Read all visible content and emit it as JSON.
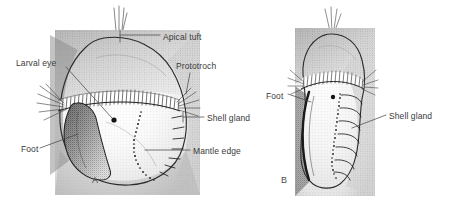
{
  "figure": {
    "type": "scientific-illustration",
    "style": "pen-and-ink stipple drawing",
    "background_color": "#ffffff",
    "ink_color": "#2b2b2b",
    "label_color": "#3a3a3a",
    "leader_color": "#4a4a4a"
  },
  "panels": [
    {
      "id": "A",
      "letter": "A",
      "view": "frontal",
      "letter_x": 92,
      "letter_y": 180
    },
    {
      "id": "B",
      "letter": "B",
      "view": "lateral",
      "letter_x": 281,
      "letter_y": 180
    }
  ],
  "labels": [
    {
      "id": "apical-tuft",
      "text": "Apical tuft",
      "panel": "A",
      "x": 163,
      "y": 38,
      "align": "left"
    },
    {
      "id": "larval-eye",
      "text": "Larval eye",
      "panel": "A",
      "x": 16,
      "y": 64,
      "align": "left"
    },
    {
      "id": "prototroch",
      "text": "Prototroch",
      "panel": "A",
      "x": 176,
      "y": 67,
      "align": "left"
    },
    {
      "id": "shell-gland-a",
      "text": "Shell gland",
      "panel": "A",
      "x": 207,
      "y": 120,
      "align": "left"
    },
    {
      "id": "mantle-edge",
      "text": "Mantle edge",
      "panel": "A",
      "x": 193,
      "y": 153,
      "align": "left"
    },
    {
      "id": "foot-a",
      "text": "Foot",
      "panel": "A",
      "x": 21,
      "y": 150,
      "align": "left"
    },
    {
      "id": "foot-b",
      "text": "Foot",
      "panel": "B",
      "x": 266,
      "y": 97,
      "align": "left"
    },
    {
      "id": "shell-gland-b",
      "text": "Shell gland",
      "panel": "B",
      "x": 389,
      "y": 118,
      "align": "left"
    }
  ],
  "structures": {
    "apical_tuft": "bundle of long stiff apical cilia at the animal pole",
    "prototroch": "dense transverse band of cilia encircling the larva",
    "larval_eye": "small dark pigmented ocellus spot",
    "foot": "shaded ventral lobe",
    "shell_gland": "ridged region along the posterior-right margin",
    "mantle_edge": "beaded dotted line marking the mantle margin"
  }
}
